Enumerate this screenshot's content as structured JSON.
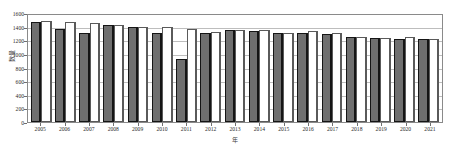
{
  "chart_data": {
    "type": "bar",
    "title": "",
    "xlabel": "年",
    "ylabel": "数量",
    "ylim": [
      0,
      1600
    ],
    "yticks": [
      0,
      200,
      400,
      600,
      800,
      1000,
      1200,
      1400,
      1600
    ],
    "grid": true,
    "legend": "none",
    "categories": [
      "2005",
      "2006",
      "2007",
      "2008",
      "2009",
      "2010",
      "2011",
      "2012",
      "2013",
      "2014",
      "2015",
      "2016",
      "2017",
      "2018",
      "2019",
      "2020",
      "2021"
    ],
    "series": [
      {
        "name": "dark",
        "color": "#6f6f6f",
        "values": [
          1470,
          1370,
          1300,
          1420,
          1395,
          1310,
          920,
          1310,
          1345,
          1340,
          1300,
          1305,
          1290,
          1250,
          1230,
          1225,
          1220
        ]
      },
      {
        "name": "light",
        "color": "#ffffff",
        "values": [
          1480,
          1470,
          1455,
          1425,
          1400,
          1400,
          1370,
          1315,
          1350,
          1345,
          1305,
          1340,
          1300,
          1255,
          1235,
          1255,
          1225
        ]
      }
    ]
  },
  "axes": {
    "y_title": "数量",
    "x_title": "年",
    "y_tick_labels": [
      "1600",
      "1400",
      "1200",
      "1000",
      "800",
      "600",
      "400",
      "200",
      "0"
    ]
  }
}
